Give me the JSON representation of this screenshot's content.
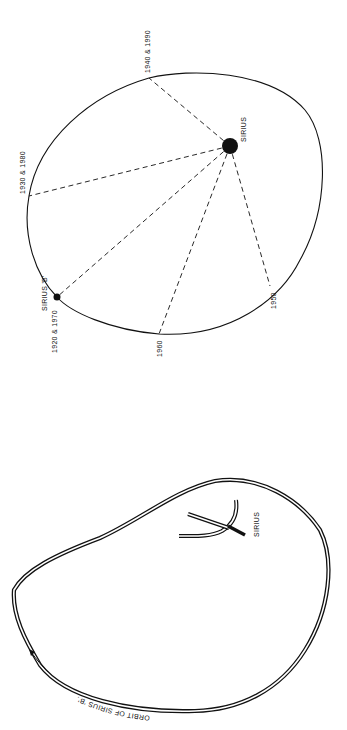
{
  "top_diagram": {
    "primary_star": {
      "label": "SIRIUS"
    },
    "companion_star": {
      "label": "SIRIUS 'B'",
      "years": "1920 & 1970"
    },
    "orbit_positions": [
      {
        "label": "1940 & 1990"
      },
      {
        "label": "1930 & 1980"
      },
      {
        "label": "1920 & 1970"
      },
      {
        "label": "1960"
      },
      {
        "label": "1950"
      }
    ]
  },
  "bottom_diagram": {
    "primary_star": {
      "label": "SIRIUS"
    },
    "orbit_label": "ORBIT OF SIRIUS 'B'."
  },
  "colors": {
    "ink": "#111111",
    "background": "#ffffff"
  }
}
